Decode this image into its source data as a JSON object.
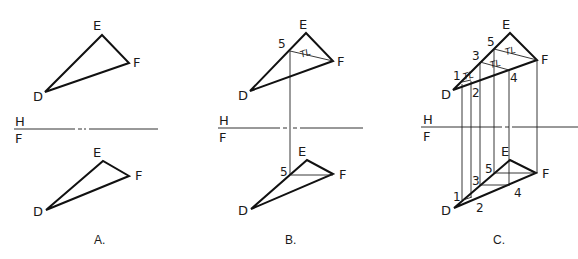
{
  "panels": [
    {
      "caption": "A.",
      "fold_labels": {
        "top": "H",
        "bottom": "F"
      },
      "top_view": {
        "E": "E",
        "F": "F",
        "D": "D"
      },
      "front_view": {
        "E": "E",
        "F": "F",
        "D": "D"
      }
    },
    {
      "caption": "B.",
      "fold_labels": {
        "top": "H",
        "bottom": "F"
      },
      "top_view": {
        "E": "E",
        "F": "F",
        "D": "D",
        "p5": "5",
        "tl": "TL"
      },
      "front_view": {
        "E": "E",
        "F": "F",
        "D": "D",
        "p5": "5"
      }
    },
    {
      "caption": "C.",
      "fold_labels": {
        "top": "H",
        "bottom": "F"
      },
      "top_view": {
        "E": "E",
        "F": "F",
        "D": "D",
        "p1": "1",
        "p2": "2",
        "p3": "3",
        "p4": "4",
        "p5": "5",
        "tl1": "TL",
        "tl2": "TL",
        "tl3": "TL"
      },
      "front_view": {
        "E": "E",
        "F": "F",
        "D": "D",
        "p1": "1",
        "p2": "2",
        "p3": "3",
        "p4": "4",
        "p5": "5"
      }
    }
  ],
  "colors": {
    "line": "#111111",
    "background": "#ffffff"
  }
}
